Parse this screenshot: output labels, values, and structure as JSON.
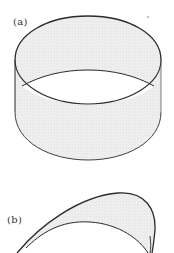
{
  "figure": {
    "panels": [
      {
        "label": "(a)",
        "description": "cylindrical band (open circular cylinder)"
      },
      {
        "label": "(b)",
        "description": "curved surface patch (saddle-like sheet)"
      }
    ],
    "colors": {
      "stroke": "#2a2a2a",
      "fill": "#ececec",
      "background": "#ffffff"
    }
  }
}
